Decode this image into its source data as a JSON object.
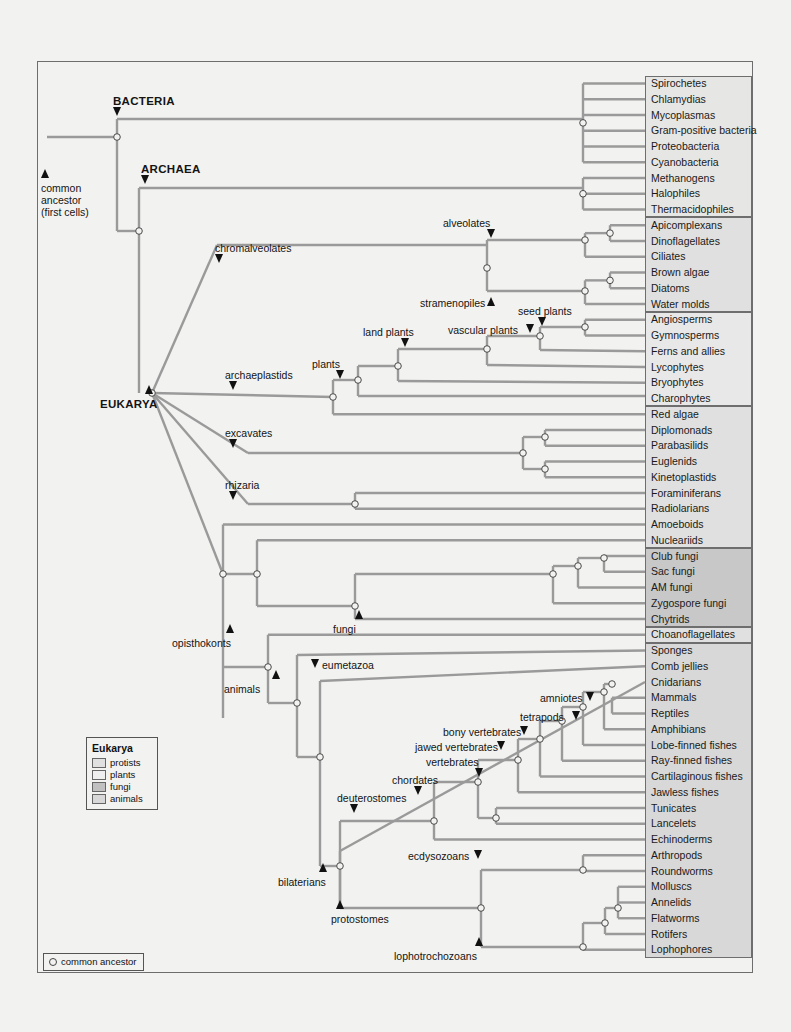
{
  "figure": {
    "branch_color": "#9a9a9a",
    "frame_color": "#6e6e6e"
  },
  "root": {
    "label_line1": "common",
    "label_line2": "ancestor",
    "label_line3": "(first cells)"
  },
  "domains": [
    {
      "id": "bacteria",
      "label": "BACTERIA"
    },
    {
      "id": "archaea",
      "label": "ARCHAEA"
    },
    {
      "id": "eukarya",
      "label": "EUKARYA"
    }
  ],
  "clade_labels": [
    {
      "id": "chromalveolates",
      "label": "chromalveolates",
      "marker": "down"
    },
    {
      "id": "alveolates",
      "label": "alveolates",
      "marker": "down"
    },
    {
      "id": "stramenopiles",
      "label": "stramenopiles",
      "marker": "up"
    },
    {
      "id": "archaeplastids",
      "label": "archaeplastids",
      "marker": "down"
    },
    {
      "id": "plants",
      "label": "plants",
      "marker": "down"
    },
    {
      "id": "land-plants",
      "label": "land plants",
      "marker": "down"
    },
    {
      "id": "vascular-plants",
      "label": "vascular plants",
      "marker": "down"
    },
    {
      "id": "seed-plants",
      "label": "seed plants",
      "marker": "down"
    },
    {
      "id": "excavates",
      "label": "excavates",
      "marker": "down"
    },
    {
      "id": "rhizaria",
      "label": "rhizaria",
      "marker": "down"
    },
    {
      "id": "opisthokonts",
      "label": "opisthokonts",
      "marker": "up"
    },
    {
      "id": "fungi",
      "label": "fungi",
      "marker": "up"
    },
    {
      "id": "animals",
      "label": "animals",
      "marker": "up"
    },
    {
      "id": "eumetazoa",
      "label": "eumetazoa",
      "marker": "down"
    },
    {
      "id": "bilaterians",
      "label": "bilaterians",
      "marker": "up"
    },
    {
      "id": "deuterostomes",
      "label": "deuterostomes",
      "marker": "down"
    },
    {
      "id": "chordates",
      "label": "chordates",
      "marker": "down"
    },
    {
      "id": "vertebrates",
      "label": "vertebrates",
      "marker": "down"
    },
    {
      "id": "jawed-vertebrates",
      "label": "jawed vertebrates",
      "marker": "down"
    },
    {
      "id": "bony-vertebrates",
      "label": "bony vertebrates",
      "marker": "down"
    },
    {
      "id": "tetrapods",
      "label": "tetrapods",
      "marker": "down"
    },
    {
      "id": "amniotes",
      "label": "amniotes",
      "marker": "down"
    },
    {
      "id": "protostomes",
      "label": "protostomes",
      "marker": "up"
    },
    {
      "id": "ecdysozoans",
      "label": "ecdysozoans",
      "marker": "down"
    },
    {
      "id": "lophotrochozoans",
      "label": "lophotrochozoans",
      "marker": "up"
    }
  ],
  "taxa": [
    {
      "name": "Spirochetes",
      "group": "bacteria"
    },
    {
      "name": "Chlamydias",
      "group": "bacteria"
    },
    {
      "name": "Mycoplasmas",
      "group": "bacteria"
    },
    {
      "name": "Gram-positive bacteria",
      "group": "bacteria"
    },
    {
      "name": "Proteobacteria",
      "group": "bacteria"
    },
    {
      "name": "Cyanobacteria",
      "group": "bacteria"
    },
    {
      "name": "Methanogens",
      "group": "archaea"
    },
    {
      "name": "Halophiles",
      "group": "archaea"
    },
    {
      "name": "Thermacidophiles",
      "group": "archaea"
    },
    {
      "name": "Apicomplexans",
      "group": "protists"
    },
    {
      "name": "Dinoflagellates",
      "group": "protists"
    },
    {
      "name": "Ciliates",
      "group": "protists"
    },
    {
      "name": "Brown algae",
      "group": "protists"
    },
    {
      "name": "Diatoms",
      "group": "protists"
    },
    {
      "name": "Water molds",
      "group": "protists"
    },
    {
      "name": "Angiosperms",
      "group": "plants"
    },
    {
      "name": "Gymnosperms",
      "group": "plants"
    },
    {
      "name": "Ferns and allies",
      "group": "plants"
    },
    {
      "name": "Lycophytes",
      "group": "plants"
    },
    {
      "name": "Bryophytes",
      "group": "plants"
    },
    {
      "name": "Charophytes",
      "group": "plants"
    },
    {
      "name": "Red algae",
      "group": "protists"
    },
    {
      "name": "Diplomonads",
      "group": "protists"
    },
    {
      "name": "Parabasilids",
      "group": "protists"
    },
    {
      "name": "Euglenids",
      "group": "protists"
    },
    {
      "name": "Kinetoplastids",
      "group": "protists"
    },
    {
      "name": "Foraminiferans",
      "group": "protists"
    },
    {
      "name": "Radiolarians",
      "group": "protists"
    },
    {
      "name": "Amoeboids",
      "group": "protists"
    },
    {
      "name": "Nucleariids",
      "group": "protists"
    },
    {
      "name": "Club fungi",
      "group": "fungi"
    },
    {
      "name": "Sac fungi",
      "group": "fungi"
    },
    {
      "name": "AM fungi",
      "group": "fungi"
    },
    {
      "name": "Zygospore fungi",
      "group": "fungi"
    },
    {
      "name": "Chytrids",
      "group": "fungi"
    },
    {
      "name": "Choanoflagellates",
      "group": "protists"
    },
    {
      "name": "Sponges",
      "group": "animals"
    },
    {
      "name": "Comb jellies",
      "group": "animals"
    },
    {
      "name": "Cnidarians",
      "group": "animals"
    },
    {
      "name": "Mammals",
      "group": "animals"
    },
    {
      "name": "Reptiles",
      "group": "animals"
    },
    {
      "name": "Amphibians",
      "group": "animals"
    },
    {
      "name": "Lobe-finned fishes",
      "group": "animals"
    },
    {
      "name": "Ray-finned fishes",
      "group": "animals"
    },
    {
      "name": "Cartilaginous fishes",
      "group": "animals"
    },
    {
      "name": "Jawless fishes",
      "group": "animals"
    },
    {
      "name": "Tunicates",
      "group": "animals"
    },
    {
      "name": "Lancelets",
      "group": "animals"
    },
    {
      "name": "Echinoderms",
      "group": "animals"
    },
    {
      "name": "Arthropods",
      "group": "animals"
    },
    {
      "name": "Roundworms",
      "group": "animals"
    },
    {
      "name": "Molluscs",
      "group": "animals"
    },
    {
      "name": "Annelids",
      "group": "animals"
    },
    {
      "name": "Flatworms",
      "group": "animals"
    },
    {
      "name": "Rotifers",
      "group": "animals"
    },
    {
      "name": "Lophophores",
      "group": "animals"
    }
  ],
  "legend": {
    "title": "Eukarya",
    "items": [
      {
        "key": "protists",
        "label": "protists",
        "color": "#e0e0e0"
      },
      {
        "key": "plants",
        "label": "plants",
        "color": "#efefef"
      },
      {
        "key": "fungi",
        "label": "fungi",
        "color": "#c0c0c0"
      },
      {
        "key": "animals",
        "label": "animals",
        "color": "#d8d8d8"
      }
    ]
  },
  "ancestor_key": {
    "symbol": "open-circle",
    "label": "common ancestor"
  }
}
